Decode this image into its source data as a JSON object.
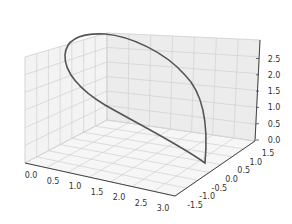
{
  "chart_data": {
    "type": "line3d",
    "title": "",
    "xlabel": "",
    "ylabel": "",
    "zlabel": "",
    "x_ticks": [
      "0.0",
      "0.5",
      "1.0",
      "1.5",
      "2.0",
      "2.5",
      "3.0"
    ],
    "y_ticks": [
      "-1.5",
      "-1.0",
      "-0.5",
      "0.0",
      "0.5",
      "1.0",
      "1.5"
    ],
    "z_ticks": [
      "0.0",
      "0.5",
      "1.0",
      "1.5",
      "2.0",
      "2.5"
    ],
    "xlim": [
      0,
      3.14
    ],
    "ylim": [
      -1.6,
      1.6
    ],
    "zlim": [
      0,
      3
    ],
    "grid": true,
    "series": [
      {
        "name": "curve",
        "color": "#555555",
        "description": "closed loop: starts at floor near x=3.0,y=0.0,z=0, rises over y=1.5 side to z~3 near x~0, returns down toward the start",
        "points_approx": [
          {
            "x": 3.0,
            "y": 0.0,
            "z": 0.0
          },
          {
            "x": 2.5,
            "y": 1.0,
            "z": 1.2
          },
          {
            "x": 1.8,
            "y": 1.4,
            "z": 2.2
          },
          {
            "x": 1.0,
            "y": 1.5,
            "z": 2.8
          },
          {
            "x": 0.3,
            "y": 1.0,
            "z": 3.0
          },
          {
            "x": 0.0,
            "y": 0.0,
            "z": 2.8
          },
          {
            "x": 0.3,
            "y": -1.0,
            "z": 2.2
          },
          {
            "x": 1.0,
            "y": -1.5,
            "z": 1.4
          },
          {
            "x": 2.0,
            "y": -1.0,
            "z": 0.6
          },
          {
            "x": 3.0,
            "y": 0.0,
            "z": 0.0
          }
        ]
      }
    ]
  },
  "colors": {
    "pane_left": "#f2f2f2",
    "pane_back": "#ebebeb",
    "pane_floor": "#f7f7f7",
    "grid": "#d0d0d0",
    "axis": "#444444",
    "curve": "#555555"
  }
}
